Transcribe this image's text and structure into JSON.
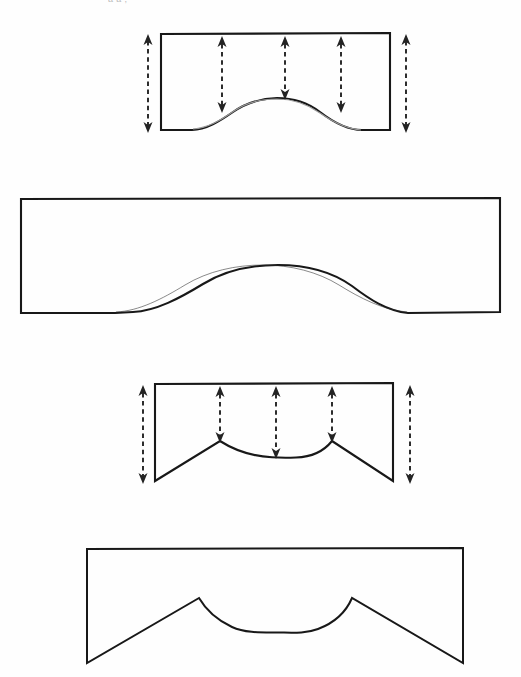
{
  "page": {
    "background_color": "#fefefe",
    "ink_color": "#1a1a1a",
    "dimension_line_color": "#2b2b2b",
    "clipped_header_text": "a a ,",
    "width": 521,
    "height": 677
  },
  "figures": [
    {
      "id": "figure-1",
      "name": "segmental-arch-narrow-dimensioned",
      "label": "Segmental arch opening in narrow wall panel with height dimensions",
      "shape_type": "segmental-arch",
      "dimensioned": true,
      "geometry": {
        "left": 161,
        "right": 390,
        "top": 33,
        "bottom": 130,
        "springing_left_x": 192,
        "springing_right_x": 362,
        "crown_y": 99,
        "crown_x": 277
      },
      "dimension_arrows": [
        {
          "name": "overall-height-left",
          "x": 148,
          "y_top": 36,
          "y_bottom": 131,
          "double_headed": true
        },
        {
          "name": "haunch-height-left",
          "x": 222,
          "y_top": 37,
          "y_bottom": 111,
          "double_headed": true
        },
        {
          "name": "crown-rise-center",
          "x": 285,
          "y_top": 37,
          "y_bottom": 98,
          "double_headed": true
        },
        {
          "name": "haunch-height-right",
          "x": 341,
          "y_top": 37,
          "y_bottom": 111,
          "double_headed": true
        },
        {
          "name": "overall-height-right",
          "x": 406,
          "y_top": 36,
          "y_bottom": 131,
          "double_headed": true
        }
      ]
    },
    {
      "id": "figure-2",
      "name": "segmental-arch-wide-plain",
      "label": "Segmental arch opening in wide wall panel, undimensioned",
      "shape_type": "segmental-arch",
      "dimensioned": false,
      "geometry": {
        "left": 21,
        "right": 500,
        "top": 198,
        "bottom": 313,
        "springing_left_x": 115,
        "springing_right_x": 408,
        "crown_y": 265,
        "crown_x": 262
      },
      "dimension_arrows": []
    },
    {
      "id": "figure-3",
      "name": "cusped-arch-narrow-dimensioned",
      "label": "Cusped/ogee-haunch arch in narrow wall panel with height dimensions",
      "shape_type": "cusped-arch",
      "dimensioned": true,
      "geometry": {
        "left": 155,
        "right": 393,
        "top": 383,
        "bottom": 481,
        "cusp_left_x": 220,
        "cusp_right_x": 332,
        "cusp_y": 441,
        "soffit_low_y": 457,
        "soffit_center_x": 276
      },
      "dimension_arrows": [
        {
          "name": "overall-height-left",
          "x": 143,
          "y_top": 386,
          "y_bottom": 482,
          "double_headed": true
        },
        {
          "name": "cusp-height-left",
          "x": 220,
          "y_top": 387,
          "y_bottom": 440,
          "double_headed": true
        },
        {
          "name": "soffit-rise-center",
          "x": 276,
          "y_top": 387,
          "y_bottom": 456,
          "double_headed": true
        },
        {
          "name": "cusp-height-right",
          "x": 332,
          "y_top": 387,
          "y_bottom": 440,
          "double_headed": true
        },
        {
          "name": "overall-height-right",
          "x": 410,
          "y_top": 386,
          "y_bottom": 482,
          "double_headed": true
        }
      ]
    },
    {
      "id": "figure-4",
      "name": "cusped-arch-wide-plain",
      "label": "Cusped/ogee-haunch arch in wide wall panel, undimensioned",
      "shape_type": "cusped-arch",
      "dimensioned": false,
      "geometry": {
        "left": 87,
        "right": 463,
        "top": 548,
        "bottom": 663,
        "cusp_left_x": 199,
        "cusp_right_x": 352,
        "cusp_y": 598,
        "soffit_low_y": 632,
        "soffit_center_x": 276
      },
      "dimension_arrows": []
    }
  ]
}
